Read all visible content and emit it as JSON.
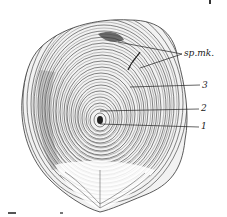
{
  "figure": {
    "labels": [
      {
        "id": "sp-mk",
        "text": "sp.mk."
      },
      {
        "id": "ring-3",
        "text": "3"
      },
      {
        "id": "ring-2",
        "text": "2"
      },
      {
        "id": "ring-1",
        "text": "1"
      }
    ],
    "ink_color": "#222222",
    "background_color": "#ffffff"
  }
}
